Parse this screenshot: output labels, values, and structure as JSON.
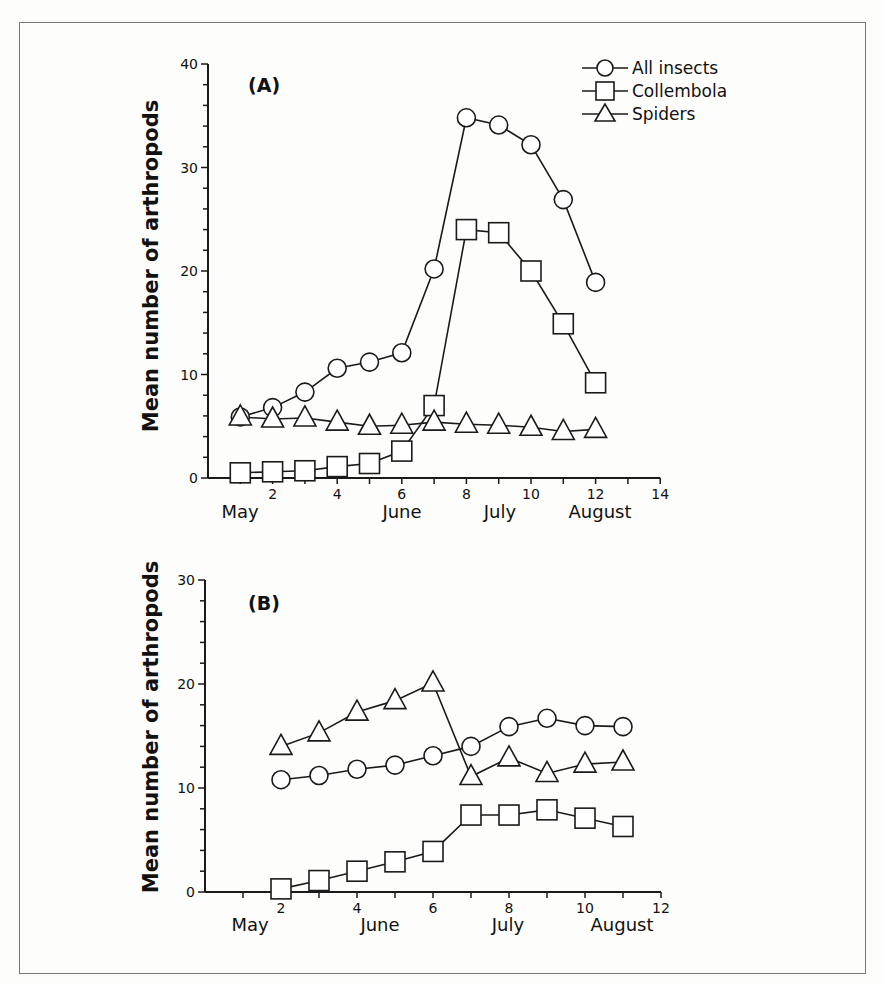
{
  "chart_data": [
    {
      "type": "line",
      "panel": "(A)",
      "title": "",
      "xlabel": "",
      "ylabel": "Mean number of arthropods",
      "xlim": [
        0,
        14
      ],
      "ylim": [
        0,
        40
      ],
      "x_ticks": [
        2,
        4,
        6,
        8,
        10,
        12,
        14
      ],
      "y_ticks": [
        0,
        10,
        20,
        30,
        40
      ],
      "month_labels": [
        "May",
        "June",
        "July",
        "August"
      ],
      "grid": false,
      "legend_position": "top-right",
      "x": [
        1,
        2,
        3,
        4,
        5,
        6,
        7,
        8,
        9,
        10,
        11,
        12
      ],
      "series": [
        {
          "name": "All insects",
          "marker": "circle",
          "values": [
            5.9,
            6.8,
            8.3,
            10.6,
            11.2,
            12.1,
            20.2,
            34.8,
            34.1,
            32.2,
            26.9,
            18.9
          ]
        },
        {
          "name": "Collembola",
          "marker": "square",
          "values": [
            0.5,
            0.6,
            0.7,
            1.1,
            1.4,
            2.6,
            7.0,
            24.0,
            23.7,
            20.0,
            14.9,
            9.2
          ]
        },
        {
          "name": "Spiders",
          "marker": "triangle",
          "values": [
            5.9,
            5.7,
            5.8,
            5.4,
            5.0,
            5.1,
            5.4,
            5.2,
            5.1,
            4.9,
            4.5,
            4.7
          ]
        }
      ]
    },
    {
      "type": "line",
      "panel": "(B)",
      "title": "",
      "xlabel": "",
      "ylabel": "Mean number of arthropods",
      "xlim": [
        0,
        12
      ],
      "ylim": [
        0,
        30
      ],
      "x_ticks": [
        2,
        4,
        6,
        8,
        10,
        12
      ],
      "y_ticks": [
        0,
        10,
        20,
        30
      ],
      "month_labels": [
        "May",
        "June",
        "July",
        "August"
      ],
      "grid": false,
      "x": [
        2,
        3,
        4,
        5,
        6,
        7,
        8,
        9,
        10,
        11
      ],
      "series": [
        {
          "name": "All insects",
          "marker": "circle",
          "values": [
            10.8,
            11.2,
            11.8,
            12.2,
            13.1,
            14.0,
            15.9,
            16.7,
            16.0,
            15.9
          ]
        },
        {
          "name": "Collembola",
          "marker": "square",
          "values": [
            0.3,
            1.1,
            2.0,
            2.9,
            3.9,
            7.4,
            7.4,
            7.9,
            7.1,
            6.3
          ]
        },
        {
          "name": "Spiders",
          "marker": "triangle",
          "values": [
            14.0,
            15.3,
            17.3,
            18.4,
            20.1,
            11.1,
            12.9,
            11.4,
            12.3,
            12.5
          ]
        }
      ]
    }
  ],
  "legend": {
    "items": [
      {
        "label": "All insects",
        "marker": "circle"
      },
      {
        "label": "Collembola",
        "marker": "square"
      },
      {
        "label": "Spiders",
        "marker": "triangle"
      }
    ]
  },
  "colors": {
    "line": "#1a1a1a",
    "marker_fill": "#ffffff",
    "frame": "#777777"
  }
}
